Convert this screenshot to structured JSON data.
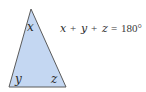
{
  "diagram": {
    "triangle": {
      "fill": "#c4d7f2",
      "stroke": "#5a5a5a",
      "vertices": {
        "top": [
          31,
          9
        ],
        "bottom_left": [
          9,
          87
        ],
        "bottom_right": [
          66,
          87
        ]
      },
      "angle_labels": {
        "top": "x",
        "bottom_left": "y",
        "bottom_right": "z"
      }
    },
    "equation": {
      "var_x": "x",
      "var_y": "y",
      "var_z": "z",
      "plus": "+",
      "equals": "=",
      "value": "180°"
    }
  }
}
